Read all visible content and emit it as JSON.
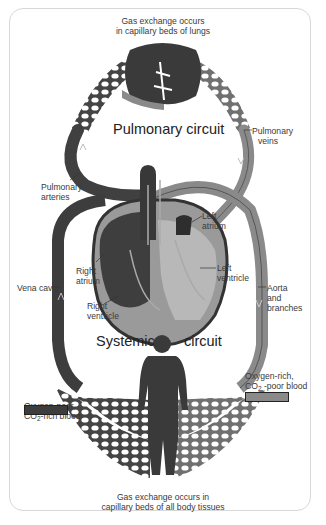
{
  "circuits": {
    "pulmonary": "Pulmonary circuit",
    "systemic_left": "Systemic",
    "systemic_right": "circuit"
  },
  "captions": {
    "top_line1": "Gas exchange occurs",
    "top_line2": "in capillary beds of lungs",
    "bottom_line1": "Gas exchange occurs in",
    "bottom_line2": "capillary beds of all body tissues"
  },
  "labels": {
    "pulmonary_veins_1": "Pulmonary",
    "pulmonary_veins_2": "veins",
    "pulmonary_arteries_1": "Pulmonary",
    "pulmonary_arteries_2": "arteries",
    "left_atrium_1": "Left",
    "left_atrium_2": "atrium",
    "right_atrium_1": "Right",
    "right_atrium_2": "atrium",
    "left_ventricle_1": "Left",
    "left_ventricle_2": "ventricle",
    "right_ventricle_1": "Right",
    "right_ventricle_2": "ventricle",
    "vena_cava": "Vena cava",
    "aorta_1": "Aorta",
    "aorta_2": "and",
    "aorta_3": "branches"
  },
  "legend": {
    "oxygen_poor_1": "Oxygen-poor,",
    "oxygen_poor_2_prefix": "CO",
    "oxygen_poor_2_sub": "2",
    "oxygen_poor_2_suffix": "-rich blood",
    "oxygen_poor_color": "#3d3d3d",
    "oxygen_rich_1": "Oxygen-rich,",
    "oxygen_rich_2_prefix": "CO",
    "oxygen_rich_2_sub": "2",
    "oxygen_rich_2_suffix": " -poor blood",
    "oxygen_rich_color": "#8a8a8a"
  },
  "colors": {
    "oxygen_poor": "#3d3d3d",
    "oxygen_rich": "#8c8c8c",
    "heart_light": "#b5b5b5",
    "frame": "#d8d8d8"
  }
}
